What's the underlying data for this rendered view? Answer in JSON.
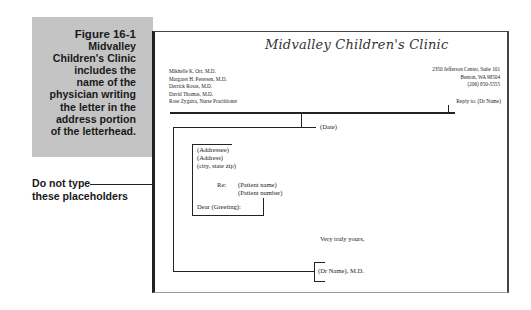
{
  "caption": {
    "title": "Figure 16-1",
    "lines": [
      "Midvalley",
      "Children's Clinic",
      "includes the",
      "name of the",
      "physician writing",
      "the letter in the",
      "address portion",
      "of the letterhead."
    ]
  },
  "note": {
    "line1": "Do not type",
    "line2": "these placeholders"
  },
  "letterhead": {
    "clinic_name": "Midvalley Children's Clinic",
    "staff": [
      "Mikhelle K. Orr, M.D.",
      "Margaret H. Petersen, M.D.",
      "Derrick Rosas, M.D.",
      "David Thomas, M.D.",
      "Rose Zygaira, Nurse Practitioner"
    ],
    "address": [
      "2350 Jefferson Center, Suite 101",
      "Benton, WA 98504",
      "(206) 850-5555"
    ],
    "reply_to": "Reply to: (Dr Name)"
  },
  "letter": {
    "date": "(Date)",
    "addressee": "(Addressee)",
    "address": "(Address)",
    "city_state_zip": "(city, state zip)",
    "re_label": "Re:",
    "patient_name": "(Patient name)",
    "patient_number": "(Patient number)",
    "greeting": "Dear (Greeting):",
    "closing": "Very truly yours,",
    "signature": "(Dr Name), M.D."
  }
}
